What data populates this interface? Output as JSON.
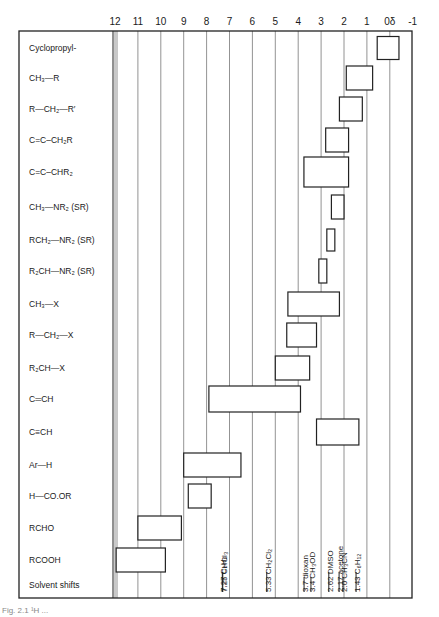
{
  "chart_data": {
    "type": "range-bar",
    "title": "",
    "xlabel": "δ (ppm)",
    "ylabel": "",
    "xlim": [
      12,
      -1
    ],
    "x_reversed": true,
    "grid": true,
    "tick_labels": [
      "12",
      "11",
      "10",
      "9",
      "8",
      "7",
      "6",
      "5",
      "4",
      "3",
      "2",
      "1",
      "0δ",
      "-1"
    ],
    "tick_values": [
      12,
      11,
      10,
      9,
      8,
      7,
      6,
      5,
      4,
      3,
      2,
      1,
      0,
      -1
    ],
    "categories": [
      "Cyclopropyl-",
      "CH₃—R",
      "R—CH₂—R′",
      "C=C–CH₂R",
      "C=C–CHR₂",
      "CH₃—NR₂ (SR)",
      "RCH₂—NR₂ (SR)",
      "R₂CH—NR₂ (SR)",
      "CH₃—X",
      "R—CH₂—X",
      "R₂CH—X",
      "C═CH",
      "C≡CH",
      "Ar—H",
      "H—CO.OR",
      "RCHO",
      "RCOOH"
    ],
    "ranges": [
      {
        "label": "Cyclopropyl-",
        "from": 0.55,
        "to": -0.4
      },
      {
        "label": "CH₃—R",
        "from": 1.9,
        "to": 0.75
      },
      {
        "label": "R—CH₂—R′",
        "from": 2.2,
        "to": 1.2
      },
      {
        "label": "C=C–CH₂R",
        "from": 2.8,
        "to": 1.8
      },
      {
        "label": "C=C–CHR₂",
        "from": 3.75,
        "to": 1.8
      },
      {
        "label": "CH₃—NR₂ (SR)",
        "from": 2.55,
        "to": 2.0
      },
      {
        "label": "RCH₂—NR₂ (SR)",
        "from": 2.75,
        "to": 2.4
      },
      {
        "label": "R₂CH—NR₂ (SR)",
        "from": 3.1,
        "to": 2.75
      },
      {
        "label": "CH₃—X",
        "from": 4.45,
        "to": 2.2
      },
      {
        "label": "R—CH₂—X",
        "from": 4.5,
        "to": 3.2
      },
      {
        "label": "R₂CH—X",
        "from": 5.0,
        "to": 3.5
      },
      {
        "label": "C═CH",
        "from": 7.9,
        "to": 3.9
      },
      {
        "label": "C≡CH",
        "from": 3.2,
        "to": 1.35
      },
      {
        "label": "Ar—H",
        "from": 9.0,
        "to": 6.5
      },
      {
        "label": "H—CO.OR",
        "from": 8.8,
        "to": 7.8
      },
      {
        "label": "RCHO",
        "from": 11.0,
        "to": 9.1
      },
      {
        "label": "RCOOH",
        "from": 11.95,
        "to": 9.8
      }
    ],
    "solvent_row_label": "Solvent shifts",
    "solvent_shifts": [
      {
        "value": 7.27,
        "label": "7.27",
        "solvent": "C₆H₆"
      },
      {
        "value": 7.25,
        "label": "7.25",
        "solvent": "CHCl₃"
      },
      {
        "value": 5.33,
        "label": "5.33",
        "solvent": "CH₂Cl₂"
      },
      {
        "value": 3.7,
        "label": "3.7",
        "solvent": "dioxan"
      },
      {
        "value": 3.4,
        "label": "3.4",
        "solvent": "CH₃OD"
      },
      {
        "value": 2.62,
        "label": "2.62",
        "solvent": "DMSO"
      },
      {
        "value": 2.17,
        "label": "2.17",
        "solvent": "acetone"
      },
      {
        "value": 2.0,
        "label": "2.0",
        "solvent": "CH₃CN"
      },
      {
        "value": 1.43,
        "label": "1.43",
        "solvent": "C₆H₁₂"
      }
    ]
  },
  "caption": "Fig. 2.1  ¹H ..."
}
